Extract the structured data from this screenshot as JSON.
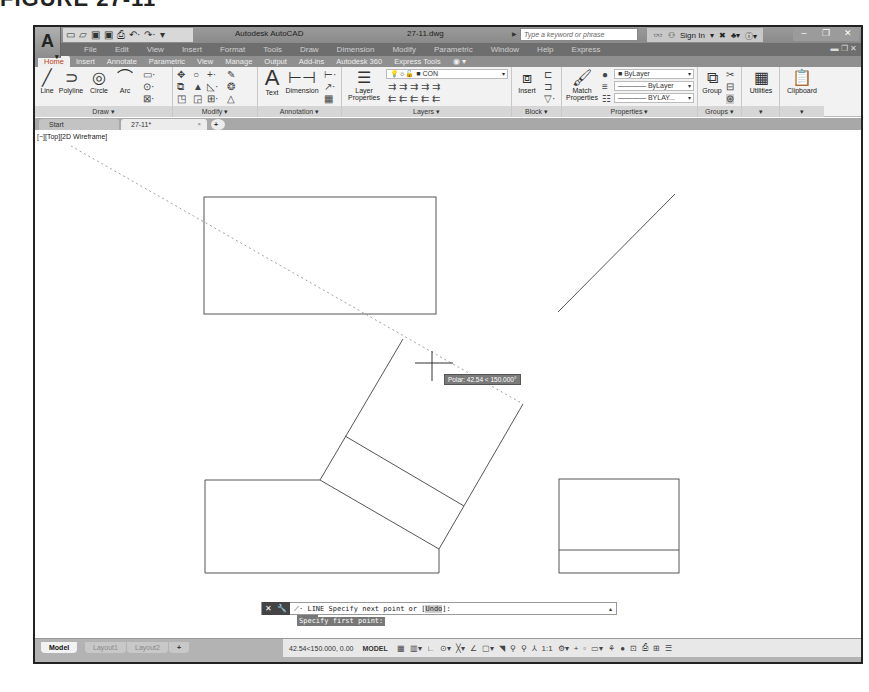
{
  "figure": {
    "caption": "FIGURE 27-11"
  },
  "titlebar": {
    "app_button": "A",
    "quick_access": [
      "new-icon",
      "open-icon",
      "save-icon",
      "saveas-icon",
      "plot-icon",
      "undo-icon",
      "redo-icon",
      "customize-icon"
    ],
    "app_name": "Autodesk AutoCAD",
    "file_name": "27-11.dwg",
    "search_placeholder": "Type a keyword or phrase",
    "sign_in": "Sign In",
    "window_controls": {
      "minimize": "–",
      "maximize": "❐",
      "close": "✕"
    }
  },
  "menubar": {
    "items": [
      "File",
      "Edit",
      "View",
      "Insert",
      "Format",
      "Tools",
      "Draw",
      "Dimension",
      "Modify",
      "Parametric",
      "Window",
      "Help",
      "Express"
    ],
    "right_controls": "▬ ❐ ✕"
  },
  "ribbon_tabs": {
    "items": [
      "Home",
      "Insert",
      "Annotate",
      "Parametric",
      "View",
      "Manage",
      "Output",
      "Add-ins",
      "Autodesk 360",
      "Express Tools",
      "◉ ▾"
    ],
    "active": "Home"
  },
  "ribbon": {
    "draw": {
      "title": "Draw ▾",
      "tools": [
        "Line",
        "Polyline",
        "Circle",
        "Arc"
      ]
    },
    "modify": {
      "title": "Modify ▾"
    },
    "annotation": {
      "title": "Annotation ▾",
      "tools": [
        "Text",
        "Dimension"
      ]
    },
    "layers": {
      "title": "Layers ▾",
      "layer_properties": "Layer Properties",
      "current_layer": "CON"
    },
    "block": {
      "title": "Block ▾",
      "insert": "Insert"
    },
    "properties": {
      "title": "Properties ▾",
      "match_properties": "Match Properties",
      "color": "ByLayer",
      "linetype": "———— ByLayer",
      "lineweight": "———— BYLAY..."
    },
    "groups": {
      "title": "Groups ▾",
      "group": "Group"
    },
    "utilities": {
      "title": "▾",
      "label": "Utilities"
    },
    "clipboard": {
      "title": "▾",
      "label": "Clipboard"
    }
  },
  "doc_tabs": {
    "start": "Start",
    "file": "27-11*",
    "close": "×",
    "new": "+"
  },
  "canvas": {
    "viewport_label": "[−][Top][2D Wireframe]",
    "polar_tooltip": "Polar: 42.54 < 150.000°"
  },
  "command": {
    "history": [
      "LINE",
      "Specify first point:"
    ],
    "prompt_prefix": "LINE Specify next point or [",
    "prompt_option": "Undo",
    "prompt_suffix": "]:",
    "buttons": [
      "✕",
      "🔧"
    ]
  },
  "statusbar": {
    "layout_tabs": [
      "Model",
      "Layout1",
      "Layout2",
      "+"
    ],
    "coordinates": "42.54<150.000, 0.00",
    "space": "MODEL",
    "icons": [
      "grid-icon",
      "snap-icon",
      "ortho-icon",
      "polar-icon",
      "isodraft-icon",
      "osnap-icon",
      "otrack-icon",
      "lineweight-icon",
      "transparency-icon",
      "annotation-scale-icon",
      "workspace-icon",
      "isolate-icon",
      "hardware-accel-icon",
      "clean-screen-icon",
      "customize-icon"
    ],
    "annotation_scale": "1:1"
  }
}
